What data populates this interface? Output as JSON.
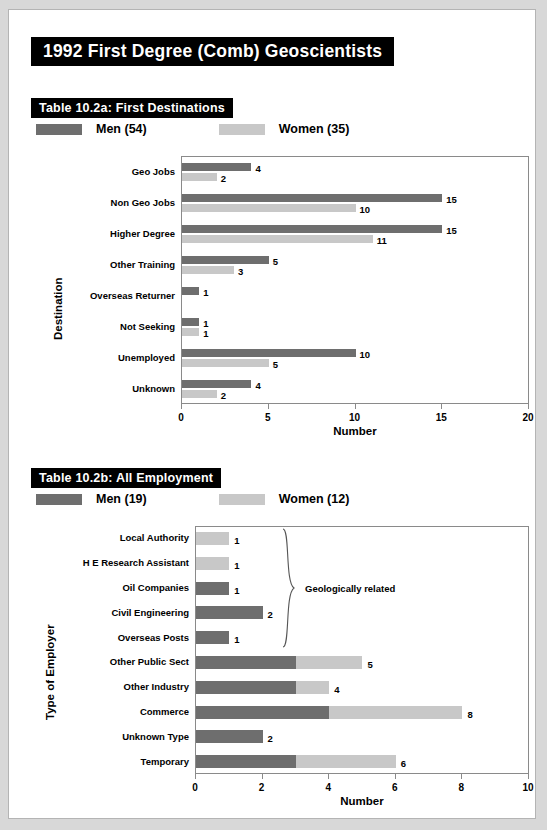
{
  "page": {
    "main_title": "1992 First Degree (Comb) Geoscientists",
    "background": "#ffffff",
    "border_color": "#b4b4b4"
  },
  "colors": {
    "men": "#6e6e6e",
    "women": "#c8c8c8",
    "axis": "#8a8a8a",
    "banner_bg": "#000000",
    "banner_text": "#ffffff"
  },
  "sections": [
    {
      "heading": "Table 10.2a: First Destinations",
      "legend": [
        {
          "label": "Men (54)",
          "color_key": "men"
        },
        {
          "label": "Women (35)",
          "color_key": "women"
        }
      ]
    },
    {
      "heading": "Table 10.2b: All Employment",
      "legend": [
        {
          "label": "Men (19)",
          "color_key": "men"
        },
        {
          "label": "Women (12)",
          "color_key": "women"
        }
      ]
    }
  ],
  "chart_data": [
    {
      "type": "bar",
      "orientation": "horizontal",
      "mode": "grouped",
      "title": "Table 10.2a: First Destinations",
      "xlabel": "Number",
      "ylabel": "Destination",
      "xlim": [
        0,
        20
      ],
      "xticks": [
        0,
        5,
        10,
        15,
        20
      ],
      "xtick_labels": [
        "0",
        "5",
        "10",
        "15",
        "20"
      ],
      "grid": false,
      "legend_position": "top-left",
      "categories": [
        "Geo Jobs",
        "Non Geo Jobs",
        "Higher Degree",
        "Other Training",
        "Overseas Returner",
        "Not Seeking",
        "Unemployed",
        "Unknown"
      ],
      "series": [
        {
          "name": "Men (54)",
          "color": "#6e6e6e",
          "values": [
            4,
            15,
            15,
            5,
            1,
            1,
            10,
            4
          ]
        },
        {
          "name": "Women (35)",
          "color": "#c8c8c8",
          "values": [
            2,
            10,
            11,
            3,
            0,
            1,
            5,
            2
          ]
        }
      ],
      "data_labels": [
        {
          "category": "Geo Jobs",
          "men": "4",
          "women": "2"
        },
        {
          "category": "Non Geo Jobs",
          "men": "15",
          "women": "10"
        },
        {
          "category": "Higher Degree",
          "men": "15",
          "women": "11"
        },
        {
          "category": "Other Training",
          "men": "5",
          "women": "3"
        },
        {
          "category": "Overseas Returner",
          "men": "1",
          "women": ""
        },
        {
          "category": "Not Seeking",
          "men": "1",
          "women": "1"
        },
        {
          "category": "Unemployed",
          "men": "10",
          "women": "5"
        },
        {
          "category": "Unknown",
          "men": "4",
          "women": "2"
        }
      ]
    },
    {
      "type": "bar",
      "orientation": "horizontal",
      "mode": "stacked",
      "title": "Table 10.2b: All Employment",
      "xlabel": "Number",
      "ylabel": "Type of Employer",
      "xlim": [
        0,
        10
      ],
      "xticks": [
        0,
        2,
        4,
        6,
        8,
        10
      ],
      "xtick_labels": [
        "0",
        "2",
        "4",
        "6",
        "8",
        "10"
      ],
      "grid": false,
      "legend_position": "top-left",
      "annotation": {
        "text": "Geologically related",
        "spans_categories": [
          "Local Authority",
          "H E Research Assistant",
          "Oil Companies",
          "Civil Engineering",
          "Overseas Posts"
        ]
      },
      "categories": [
        "Local Authority",
        "H E Research Assistant",
        "Oil Companies",
        "Civil Engineering",
        "Overseas Posts",
        "Other Public Sect",
        "Other Industry",
        "Commerce",
        "Unknown Type",
        "Temporary"
      ],
      "series": [
        {
          "name": "Men (19)",
          "color": "#6e6e6e",
          "values": [
            0,
            0,
            1,
            2,
            1,
            3,
            3,
            4,
            2,
            3
          ]
        },
        {
          "name": "Women (12)",
          "color": "#c8c8c8",
          "values": [
            1,
            1,
            0,
            0,
            0,
            2,
            1,
            4,
            0,
            3
          ]
        }
      ],
      "totals": [
        1,
        1,
        1,
        2,
        1,
        5,
        4,
        8,
        2,
        6
      ],
      "total_labels": [
        "1",
        "1",
        "1",
        "2",
        "1",
        "5",
        "4",
        "8",
        "2",
        "6"
      ]
    }
  ]
}
